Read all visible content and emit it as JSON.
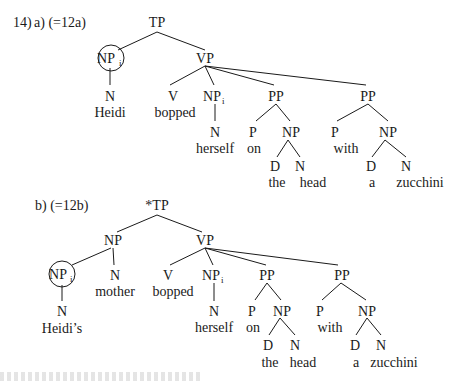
{
  "example_number": "14)",
  "tree_a": {
    "label": "a) (=12a)",
    "nodes": {
      "tp": "TP",
      "np_subj": "NP",
      "np_subj_index": "i",
      "n_subj": "N",
      "w_subj": "Heidi",
      "vp": "VP",
      "v": "V",
      "w_v": "bopped",
      "np_obj": "NP",
      "np_obj_index": "i",
      "n_obj": "N",
      "w_obj": "herself",
      "pp1": "PP",
      "p1": "P",
      "w_p1": "on",
      "np_pp1": "NP",
      "d1": "D",
      "w_d1": "the",
      "n1": "N",
      "w_n1": "head",
      "pp2": "PP",
      "p2": "P",
      "w_p2": "with",
      "np_pp2": "NP",
      "d2": "D",
      "w_d2": "a",
      "n2": "N",
      "w_n2": "zucchini"
    }
  },
  "tree_b": {
    "label": "b) (=12b)",
    "nodes": {
      "tp": "*TP",
      "np_subj": "NP",
      "np_poss": "NP",
      "np_poss_index": "i",
      "n_poss": "N",
      "w_poss": "Heidi’s",
      "n_head": "N",
      "w_head": "mother",
      "vp": "VP",
      "v": "V",
      "w_v": "bopped",
      "np_obj": "NP",
      "np_obj_index": "i",
      "n_obj": "N",
      "w_obj": "herself",
      "pp1": "PP",
      "p1": "P",
      "w_p1": "on",
      "np_pp1": "NP",
      "d1": "D",
      "w_d1": "the",
      "n1": "N",
      "w_n1": "head",
      "pp2": "PP",
      "p2": "P",
      "w_p2": "with",
      "np_pp2": "NP",
      "d2": "D",
      "w_d2": "a",
      "n2": "N",
      "w_n2": "zucchini"
    }
  }
}
